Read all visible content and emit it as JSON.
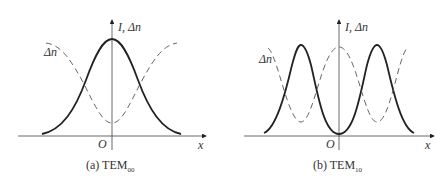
{
  "panels": [
    {
      "id": "a",
      "caption_prefix": "(a)  TEM",
      "caption_sub": "00",
      "y_axis_label_I": "I",
      "y_axis_label_sep": ",",
      "y_axis_label_dn": "Δn",
      "x_axis_label": "x",
      "origin_label": "O",
      "curve_label": "Δn",
      "solid_curve": "Intensity I (Gaussian, single peak at x=0)",
      "dashed_curve": "Δn (inverted Gaussian, minimum at x=0)"
    },
    {
      "id": "b",
      "caption_prefix": "(b)  TEM",
      "caption_sub": "10",
      "y_axis_label_I": "I",
      "y_axis_label_sep": ",",
      "y_axis_label_dn": "Δn",
      "x_axis_label": "x",
      "origin_label": "O",
      "curve_label": "Δn",
      "solid_curve": "Intensity I (two peaks symmetric about x=0, zero at origin)",
      "dashed_curve": "Δn (maximum at x=0, minima under intensity peaks)"
    }
  ],
  "colors": {
    "line": "#222222",
    "text": "#333333",
    "background": "#ffffff"
  }
}
